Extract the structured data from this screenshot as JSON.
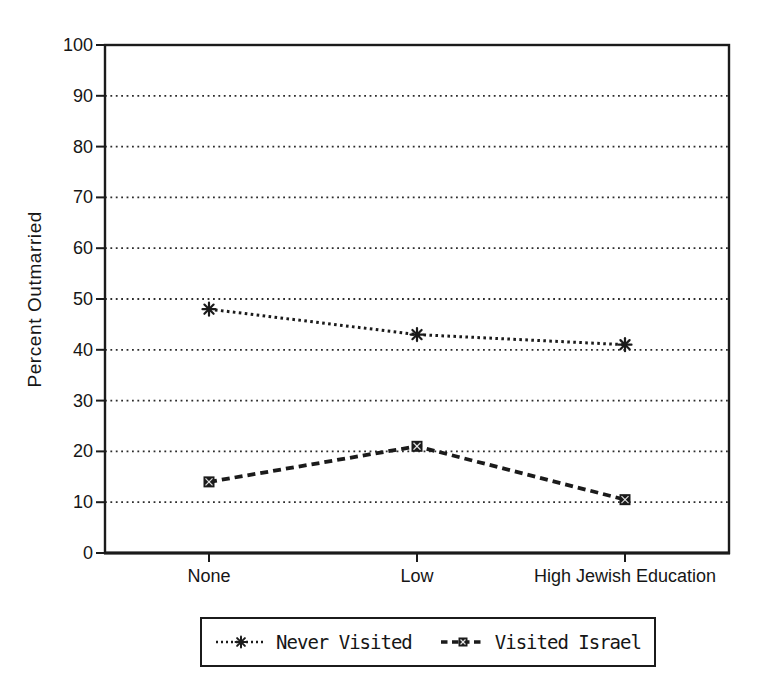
{
  "figure": {
    "background": "#ffffff",
    "ink_color": "#1b1b1b"
  },
  "chart_data": {
    "type": "line",
    "title": "",
    "categories": [
      "None",
      "Low",
      "High Jewish Education"
    ],
    "series": [
      {
        "name": "Never Visited",
        "values": [
          48,
          43,
          41
        ],
        "line_style": "dotted",
        "marker": "asterisk"
      },
      {
        "name": "Visited Israel",
        "values": [
          14,
          21,
          10.5
        ],
        "line_style": "dashed",
        "marker": "filled-square-x"
      }
    ],
    "xlabel": "",
    "ylabel": "Percent Outmarried",
    "ylim": [
      0,
      100
    ],
    "yticks": [
      0,
      10,
      20,
      30,
      40,
      50,
      60,
      70,
      80,
      90,
      100
    ],
    "grid": "horizontal-dotted",
    "legend_position": "bottom"
  }
}
